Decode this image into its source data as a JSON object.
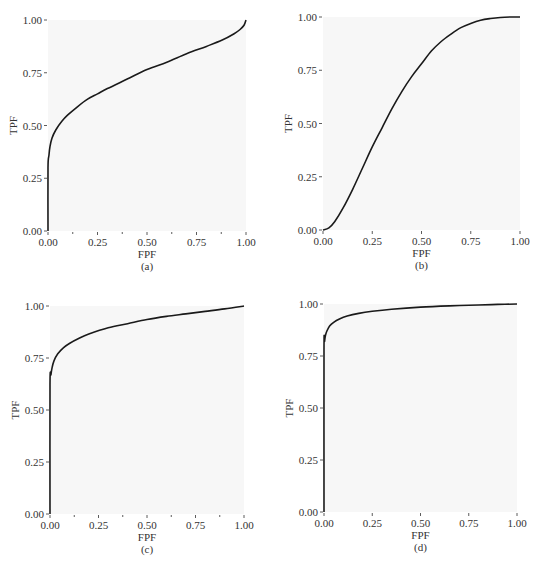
{
  "chart_data": [
    {
      "id": "a",
      "type": "line",
      "caption": "(a)",
      "xlabel": "FPF",
      "ylabel": "TPF",
      "xlim": [
        0,
        1
      ],
      "ylim": [
        0,
        1
      ],
      "xticks": [
        "0.00",
        "0.25",
        "0.50",
        "0.75",
        "1.00"
      ],
      "yticks": [
        "0.00",
        "0.25",
        "0.50",
        "0.75",
        "1.00"
      ],
      "minor_xticks": [
        0.125,
        0.375,
        0.625,
        0.875
      ],
      "grid": false,
      "plot_box": {
        "left": 48,
        "right": 246,
        "top": 20,
        "bottom": 231
      },
      "series": [
        {
          "name": "ROC curve",
          "x": [
            0.0,
            0.0,
            0.005,
            0.01,
            0.02,
            0.04,
            0.07,
            0.1,
            0.15,
            0.2,
            0.25,
            0.3,
            0.4,
            0.5,
            0.6,
            0.7,
            0.8,
            0.88,
            0.94,
            0.97,
            0.99,
            1.0
          ],
          "y": [
            0.0,
            0.3,
            0.36,
            0.4,
            0.44,
            0.48,
            0.52,
            0.55,
            0.59,
            0.625,
            0.65,
            0.675,
            0.72,
            0.765,
            0.8,
            0.84,
            0.875,
            0.905,
            0.935,
            0.955,
            0.975,
            1.0
          ]
        }
      ]
    },
    {
      "id": "b",
      "type": "line",
      "caption": "(b)",
      "xlabel": "FPF",
      "ylabel": "TPF",
      "xlim": [
        0,
        1
      ],
      "ylim": [
        0,
        1
      ],
      "xticks": [
        "0.00",
        "0.25",
        "0.50",
        "0.75",
        "1.00"
      ],
      "yticks": [
        "0.00",
        "0.25",
        "0.50",
        "0.75",
        "1.00"
      ],
      "minor_xticks": [],
      "grid": false,
      "plot_box": {
        "left": 323,
        "right": 520,
        "top": 17,
        "bottom": 230
      },
      "series": [
        {
          "name": "ROC curve",
          "x": [
            0.0,
            0.03,
            0.06,
            0.1,
            0.15,
            0.2,
            0.25,
            0.3,
            0.35,
            0.4,
            0.45,
            0.5,
            0.55,
            0.6,
            0.65,
            0.7,
            0.75,
            0.8,
            0.85,
            0.9,
            0.95,
            1.0
          ],
          "y": [
            0.0,
            0.01,
            0.04,
            0.1,
            0.19,
            0.29,
            0.39,
            0.48,
            0.57,
            0.65,
            0.72,
            0.78,
            0.84,
            0.885,
            0.92,
            0.95,
            0.97,
            0.985,
            0.993,
            0.998,
            1.0,
            1.0
          ]
        }
      ]
    },
    {
      "id": "c",
      "type": "line",
      "caption": "(c)",
      "xlabel": "FPF",
      "ylabel": "TPF",
      "xlim": [
        0,
        1
      ],
      "ylim": [
        0,
        1
      ],
      "xticks": [
        "0.00",
        "0.25",
        "0.50",
        "0.75",
        "1.00"
      ],
      "yticks": [
        "0.00",
        "0.25",
        "0.50",
        "0.75",
        "1.00"
      ],
      "minor_xticks": [
        0.125,
        0.375,
        0.625,
        0.875
      ],
      "grid": false,
      "plot_box": {
        "left": 50,
        "right": 244,
        "top": 306,
        "bottom": 514
      },
      "series": [
        {
          "name": "ROC curve",
          "x": [
            0.0,
            0.0,
            0.005,
            0.01,
            0.02,
            0.04,
            0.07,
            0.1,
            0.15,
            0.2,
            0.3,
            0.4,
            0.5,
            0.6,
            0.7,
            0.8,
            0.9,
            1.0
          ],
          "y": [
            0.0,
            0.62,
            0.67,
            0.7,
            0.735,
            0.77,
            0.8,
            0.82,
            0.845,
            0.865,
            0.895,
            0.915,
            0.935,
            0.95,
            0.962,
            0.974,
            0.986,
            1.0
          ]
        }
      ]
    },
    {
      "id": "d",
      "type": "line",
      "caption": "(d)",
      "xlabel": "FPF",
      "ylabel": "TPF",
      "xlim": [
        0,
        1
      ],
      "ylim": [
        0,
        1
      ],
      "xticks": [
        "0.00",
        "0.25",
        "0.50",
        "0.75",
        "1.00"
      ],
      "yticks": [
        "0.00",
        "0.25",
        "0.50",
        "0.75",
        "1.00"
      ],
      "minor_xticks": [],
      "grid": false,
      "plot_box": {
        "left": 324,
        "right": 517,
        "top": 304,
        "bottom": 512
      },
      "series": [
        {
          "name": "ROC curve",
          "x": [
            0.0,
            0.0,
            0.003,
            0.008,
            0.015,
            0.03,
            0.05,
            0.08,
            0.12,
            0.18,
            0.25,
            0.35,
            0.5,
            0.65,
            0.8,
            0.9,
            1.0
          ],
          "y": [
            0.0,
            0.78,
            0.82,
            0.85,
            0.87,
            0.895,
            0.912,
            0.928,
            0.942,
            0.955,
            0.965,
            0.975,
            0.985,
            0.991,
            0.995,
            0.998,
            1.0
          ]
        }
      ]
    }
  ],
  "style": {
    "plot_background": "#f7f7f7",
    "curve_color": "#1a1a1a",
    "axis_color": "#333333",
    "text_color": "#333333"
  }
}
